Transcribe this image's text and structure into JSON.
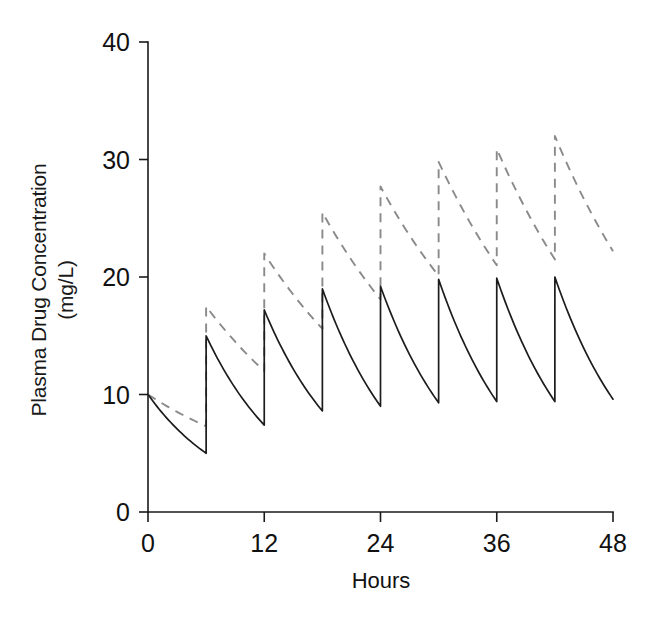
{
  "chart_data": {
    "type": "line",
    "title": "",
    "xlabel": "Hours",
    "ylabel": "Plasma Drug Concentration  (mg/L)",
    "ylabel_line1": "Plasma Drug Concentration",
    "ylabel_line2": "(mg/L)",
    "xlim": [
      0,
      48
    ],
    "ylim": [
      0,
      40
    ],
    "xticks": [
      0,
      12,
      24,
      36,
      48
    ],
    "xtick_labels": [
      "0",
      "12",
      "24",
      "36",
      "48"
    ],
    "yticks": [
      0,
      10,
      20,
      30,
      40
    ],
    "ytick_labels": [
      "0",
      "10",
      "20",
      "30",
      "40"
    ],
    "grid": false,
    "legend": "none",
    "dosing_interval_hours": 6,
    "dose_times": [
      0,
      6,
      12,
      18,
      24,
      30,
      36,
      42
    ],
    "series": [
      {
        "name": "short-half-life-drug",
        "style": "solid",
        "color": "#1c1c1c",
        "half_life_hours": 6.0,
        "dose_increment_mg_per_L": 10,
        "peaks": [
          10.0,
          15.0,
          17.2,
          19.0,
          19.2,
          19.8,
          19.9,
          20.0
        ],
        "troughs": [
          5.0,
          7.4,
          8.6,
          9.0,
          9.3,
          9.4,
          9.4,
          9.6
        ],
        "x": [
          0,
          6,
          6,
          12,
          12,
          18,
          18,
          24,
          24,
          30,
          30,
          36,
          36,
          42,
          42,
          48
        ],
        "y": [
          10.0,
          5.0,
          15.0,
          7.4,
          17.2,
          8.6,
          19.0,
          9.0,
          19.2,
          9.3,
          19.8,
          9.4,
          19.9,
          9.4,
          20.0,
          9.6
        ]
      },
      {
        "name": "long-half-life-drug",
        "style": "dashed",
        "color": "#8a8a8a",
        "half_life_hours": 11.0,
        "dose_increment_mg_per_L": 10,
        "peaks": [
          10.0,
          17.5,
          22.0,
          25.5,
          27.7,
          29.8,
          30.9,
          32.0
        ],
        "troughs": [
          7.3,
          12.0,
          15.6,
          18.1,
          20.1,
          21.0,
          21.5,
          22.2
        ],
        "x": [
          0,
          6,
          6,
          12,
          12,
          18,
          18,
          24,
          24,
          30,
          30,
          36,
          36,
          42,
          42,
          48
        ],
        "y": [
          10.0,
          7.3,
          17.5,
          12.0,
          22.0,
          15.6,
          25.5,
          18.1,
          27.7,
          20.1,
          29.8,
          21.0,
          30.9,
          21.5,
          32.0,
          22.2
        ]
      }
    ]
  },
  "figure": {
    "background_color": "#ffffff",
    "axis_color": "#1a1a1a"
  }
}
